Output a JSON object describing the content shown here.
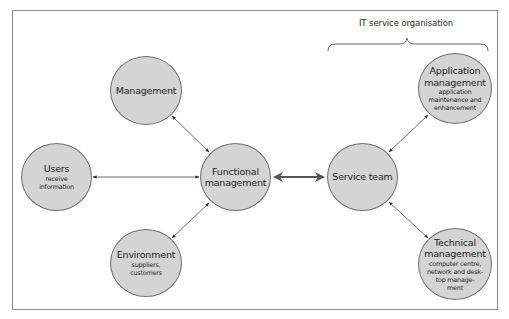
{
  "diagram": {
    "type": "hub-and-spoke relationship diagram",
    "group_label": "IT service organisation",
    "nodes": {
      "management": {
        "title": "Management",
        "subtitle": ""
      },
      "users": {
        "title": "Users",
        "subtitle": "receive information"
      },
      "functional": {
        "title_line1": "Functional",
        "title_line2": "management"
      },
      "environment": {
        "title": "Environment",
        "subtitle_line1": "suppliers,",
        "subtitle_line2": "customers"
      },
      "service_team": {
        "title": "Service team"
      },
      "application": {
        "title_line1": "Application",
        "title_line2": "management",
        "subtitle_line1": "application",
        "subtitle_line2": "maintenance and",
        "subtitle_line3": "enhancement"
      },
      "technical": {
        "title_line1": "Technical",
        "title_line2": "management",
        "subtitle_line1": "computer centre,",
        "subtitle_line2": "network and desk-",
        "subtitle_line3": "top manage-",
        "subtitle_line4": "ment"
      }
    },
    "edges": [
      {
        "from": "Management",
        "to": "Functional management",
        "style": "thin double-headed arrow"
      },
      {
        "from": "Users",
        "to": "Functional management",
        "style": "thin double-headed arrow"
      },
      {
        "from": "Environment",
        "to": "Functional management",
        "style": "thin double-headed arrow"
      },
      {
        "from": "Functional management",
        "to": "Service team",
        "style": "thick double-headed arrow"
      },
      {
        "from": "Service team",
        "to": "Application management",
        "style": "thin double-headed arrow"
      },
      {
        "from": "Service team",
        "to": "Technical management",
        "style": "thin double-headed arrow"
      }
    ],
    "colors": {
      "node_fill": "#d4d4d4",
      "node_stroke": "#6e6e6e",
      "line": "#4a4a4a",
      "frame": "#8a8a8a"
    }
  }
}
